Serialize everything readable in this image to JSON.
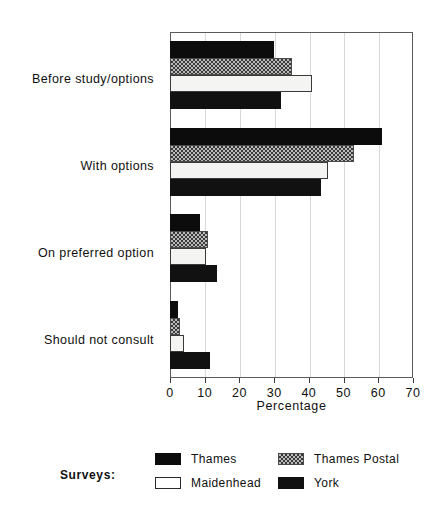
{
  "chart_data": {
    "type": "bar",
    "orientation": "horizontal",
    "title": "",
    "xlabel": "Percentage",
    "ylabel": "",
    "xlim": [
      0,
      70
    ],
    "xticks": [
      0,
      10,
      20,
      30,
      40,
      50,
      60,
      70
    ],
    "grid": true,
    "grid_axis": "x",
    "legend_position": "bottom",
    "legend_title": "Surveys:",
    "categories": [
      "Before study/options",
      "With options",
      "On preferred option",
      "Should not consult"
    ],
    "series": [
      {
        "name": "Thames",
        "fill": "solid-black",
        "color": "#0c0c0c",
        "values": [
          30,
          61,
          8.5,
          2.3
        ]
      },
      {
        "name": "Thames Postal",
        "fill": "checkered-gray",
        "color": "#b9b9b9",
        "values": [
          35,
          53,
          11,
          2.8
        ]
      },
      {
        "name": "Maidenhead",
        "fill": "open-white",
        "color": "#ffffff",
        "values": [
          41,
          45.5,
          10.5,
          4
        ]
      },
      {
        "name": "York",
        "fill": "solid-black",
        "color": "#111111",
        "values": [
          32,
          43.5,
          13.5,
          11.4
        ]
      }
    ]
  },
  "axis": {
    "tick_labels": [
      "0",
      "10",
      "20",
      "30",
      "40",
      "50",
      "60",
      "70"
    ],
    "x_title": "Percentage"
  },
  "legend": {
    "title": "Surveys:",
    "entries": [
      {
        "label": "Thames",
        "swatch": "solid"
      },
      {
        "label": "Thames Postal",
        "swatch": "hatch"
      },
      {
        "label": "Maidenhead",
        "swatch": "open"
      },
      {
        "label": "York",
        "swatch": "york"
      }
    ]
  }
}
